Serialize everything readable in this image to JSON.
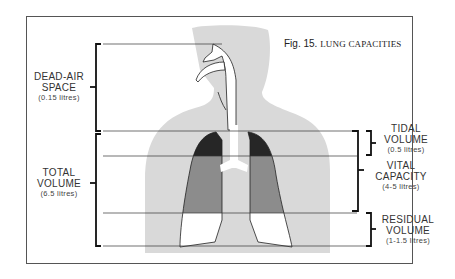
{
  "figure": {
    "number": "Fig. 15.",
    "title": "LUNG CAPACITIES"
  },
  "labels": {
    "dead_air": {
      "line1": "DEAD-AIR",
      "line2": "SPACE",
      "sub": "(0.15 litres)"
    },
    "total": {
      "line1": "TOTAL",
      "line2": "VOLUME",
      "sub": "(6.5 litres)"
    },
    "tidal": {
      "line1": "TIDAL",
      "line2": "VOLUME",
      "sub": "(0.5 litres)"
    },
    "vital": {
      "line1": "VITAL",
      "line2": "CAPACITY",
      "sub": "(4-5 litres)"
    },
    "residual": {
      "line1": "RESIDUAL",
      "line2": "VOLUME",
      "sub": "(1-1.5 litres)"
    }
  },
  "colors": {
    "silhouette": "#d9d9d9",
    "tidal_fill": "#262626",
    "vital_fill": "#8c8c8c",
    "residual_fill": "#ffffff",
    "line": "#333333"
  }
}
